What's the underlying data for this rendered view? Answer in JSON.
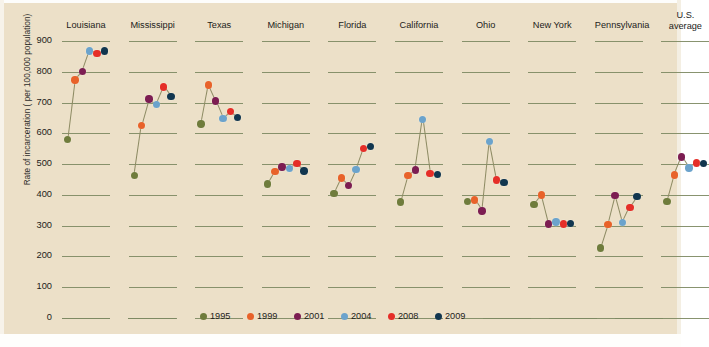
{
  "chart_data": {
    "type": "line",
    "title": "",
    "xlabel": "",
    "ylabel": "Rate of incarceration ( per 100,000 population)",
    "ylim": [
      0,
      900
    ],
    "yticks": [
      0,
      100,
      200,
      300,
      400,
      500,
      600,
      700,
      800,
      900
    ],
    "grid": true,
    "legend_position": "bottom",
    "legend": [
      {
        "label": "1995",
        "color": "#6f7c3c"
      },
      {
        "label": "1999",
        "color": "#e8622a"
      },
      {
        "label": "2001",
        "color": "#7c1d52"
      },
      {
        "label": "2004",
        "color": "#6ba3cc"
      },
      {
        "label": "2008",
        "color": "#e52e28"
      },
      {
        "label": "2009",
        "color": "#11364f"
      }
    ],
    "categories": [
      "1995",
      "1999",
      "2001",
      "2004",
      "2008",
      "2009"
    ],
    "panels": [
      {
        "name": "Louisiana",
        "values": [
          580,
          773,
          800,
          868,
          860,
          868
        ]
      },
      {
        "name": "Mississippi",
        "values": [
          463,
          626,
          711,
          694,
          750,
          719
        ]
      },
      {
        "name": "Texas",
        "values": [
          630,
          757,
          705,
          648,
          670,
          652
        ]
      },
      {
        "name": "Michigan",
        "values": [
          435,
          477,
          491,
          486,
          503,
          478
        ]
      },
      {
        "name": "Florida",
        "values": [
          405,
          455,
          430,
          482,
          550,
          558
        ]
      },
      {
        "name": "California",
        "values": [
          377,
          463,
          481,
          645,
          470,
          467
        ]
      },
      {
        "name": "Ohio",
        "values": [
          378,
          383,
          348,
          573,
          448,
          440
        ]
      },
      {
        "name": "New York",
        "values": [
          368,
          400,
          306,
          312,
          306,
          307
        ]
      },
      {
        "name": "Pennsylvania",
        "values": [
          228,
          303,
          398,
          310,
          360,
          395
        ]
      },
      {
        "name": "U.S. average",
        "values": [
          378,
          465,
          523,
          487,
          504,
          502
        ]
      }
    ]
  },
  "axis": {
    "y_title": "Rate of incarceration ( per 100,000 population)",
    "tick_labels": [
      "900",
      "800",
      "700",
      "600",
      "500",
      "400",
      "300",
      "200",
      "100",
      "0"
    ]
  },
  "panel_titles": [
    "Louisiana",
    "Mississippi",
    "Texas",
    "Michigan",
    "Florida",
    "California",
    "Ohio",
    "New York",
    "Pennsylvania",
    "U.S.\naverage"
  ],
  "colors": {
    "background": "#ece0c8",
    "gridline": "#7e8a63",
    "connector": "#8d8a63",
    "text": "#1c1c1a"
  }
}
